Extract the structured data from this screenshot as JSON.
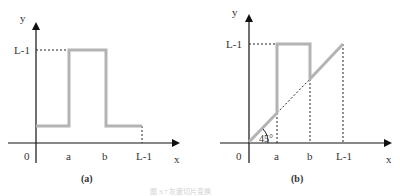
{
  "panel_a": {
    "axis_y_label": "y",
    "axis_x_label": "x",
    "origin_label": "0",
    "y_tick_label": "L-1",
    "x_ticks": [
      "a",
      "b",
      "L-1"
    ],
    "caption": "(a)",
    "description": "Gray-level slicing: high value L-1 for inputs in [a,b], constant low value elsewhere"
  },
  "panel_b": {
    "axis_y_label": "y",
    "axis_x_label": "x",
    "origin_label": "0",
    "y_tick_label": "L-1",
    "x_ticks": [
      "a",
      "b",
      "L-1"
    ],
    "angle_label": "45°",
    "caption": "(b)",
    "description": "Gray-level slicing: high value L-1 for inputs in [a,b], identity (45° line) elsewhere"
  },
  "colors": {
    "axis": "#111111",
    "curve": "#b3b3b3",
    "dashed": "#222222"
  },
  "figure_caption": "图 3.7 灰度切片变换"
}
